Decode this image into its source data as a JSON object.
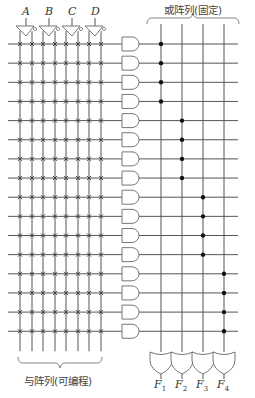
{
  "diagram": {
    "title_or_array": "或阵列(固定)",
    "title_and_array": "与阵列(可编程)",
    "inputs": [
      "A",
      "B",
      "C",
      "D"
    ],
    "outputs": [
      {
        "name": "F",
        "sub": "1"
      },
      {
        "name": "F",
        "sub": "2"
      },
      {
        "name": "F",
        "sub": "3"
      },
      {
        "name": "F",
        "sub": "4"
      }
    ],
    "product_terms": 16,
    "or_connections": [
      [
        0,
        1,
        2,
        3
      ],
      [
        4,
        5,
        6,
        7
      ],
      [
        8,
        9,
        10,
        11
      ],
      [
        12,
        13,
        14,
        15
      ]
    ],
    "colors": {
      "line": "#555555",
      "dot": "#111111",
      "gate": "#777777"
    }
  }
}
